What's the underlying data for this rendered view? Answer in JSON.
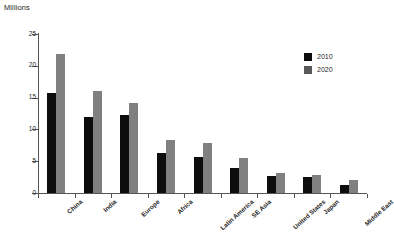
{
  "chart_data": {
    "type": "bar",
    "title": "Millions",
    "xlabel": "",
    "ylabel": "",
    "ylim": [
      0,
      25
    ],
    "yticks": [
      0,
      5,
      10,
      15,
      20,
      25
    ],
    "grid": false,
    "legend_position": "top-right",
    "categories": [
      "China",
      "India",
      "Europe",
      "Africa",
      "Latin America",
      "SE Asia",
      "United States",
      "Japan",
      "Middle East"
    ],
    "series": [
      {
        "name": "2010",
        "color": "#0d0d0d",
        "values": [
          15.8,
          12.0,
          12.2,
          6.3,
          5.7,
          4.0,
          2.6,
          2.5,
          1.2
        ]
      },
      {
        "name": "2020",
        "color": "#808080",
        "values": [
          21.8,
          16.1,
          14.1,
          8.3,
          7.8,
          5.5,
          3.1,
          2.9,
          2.0
        ]
      }
    ]
  },
  "legend": {
    "items": [
      {
        "label": "2010"
      },
      {
        "label": "2020"
      }
    ]
  }
}
